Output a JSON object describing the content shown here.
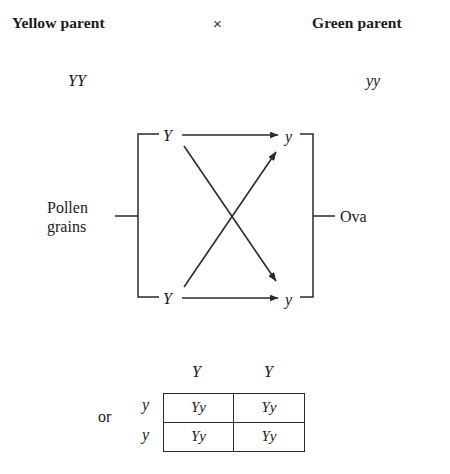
{
  "header": {
    "left_parent": "Yellow parent",
    "cross_symbol": "×",
    "right_parent": "Green parent"
  },
  "genotypes": {
    "left": "YY",
    "right": "yy"
  },
  "cross_diagram": {
    "left_side_label_line1": "Pollen",
    "left_side_label_line2": "grains",
    "right_side_label": "Ova",
    "left_gametes": [
      "Y",
      "Y"
    ],
    "right_gametes": [
      "y",
      "y"
    ],
    "arrows": [
      {
        "name": "top-horizontal",
        "from": "Y-top",
        "to": "y-top"
      },
      {
        "name": "bottom-horizontal",
        "from": "Y-bottom",
        "to": "y-bottom"
      },
      {
        "name": "diagonal-up",
        "from": "Y-bottom",
        "to": "y-top"
      },
      {
        "name": "diagonal-down",
        "from": "Y-top",
        "to": "y-bottom"
      }
    ]
  },
  "punnett": {
    "or_label": "or",
    "column_headers": [
      "Y",
      "Y"
    ],
    "row_headers": [
      "y",
      "y"
    ],
    "cells": [
      "Yy",
      "Yy",
      "Yy",
      "Yy"
    ]
  },
  "colors": {
    "ink": "#1a1a1a",
    "line": "#2b2b2b",
    "background": "#ffffff"
  }
}
